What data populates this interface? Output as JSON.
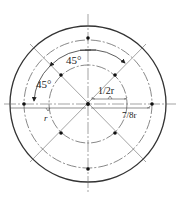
{
  "diagram": {
    "center_label": "o",
    "labels": {
      "angle_top": "45°",
      "angle_left": "45°",
      "half_r": "1/2r",
      "seven_eighths_r": "7/8r",
      "r": "r"
    },
    "circles": [
      {
        "name": "outer",
        "style": "solid",
        "relative_radius": "r"
      },
      {
        "name": "middle",
        "style": "dash-dot",
        "relative_radius": "7/8r"
      },
      {
        "name": "inner",
        "style": "dash-dot",
        "relative_radius": "1/2r"
      }
    ],
    "points": {
      "middle_circle": 4,
      "inner_circle": 4,
      "center": 1
    },
    "colors": {
      "line": "#333333",
      "centerline": "#777777"
    }
  }
}
